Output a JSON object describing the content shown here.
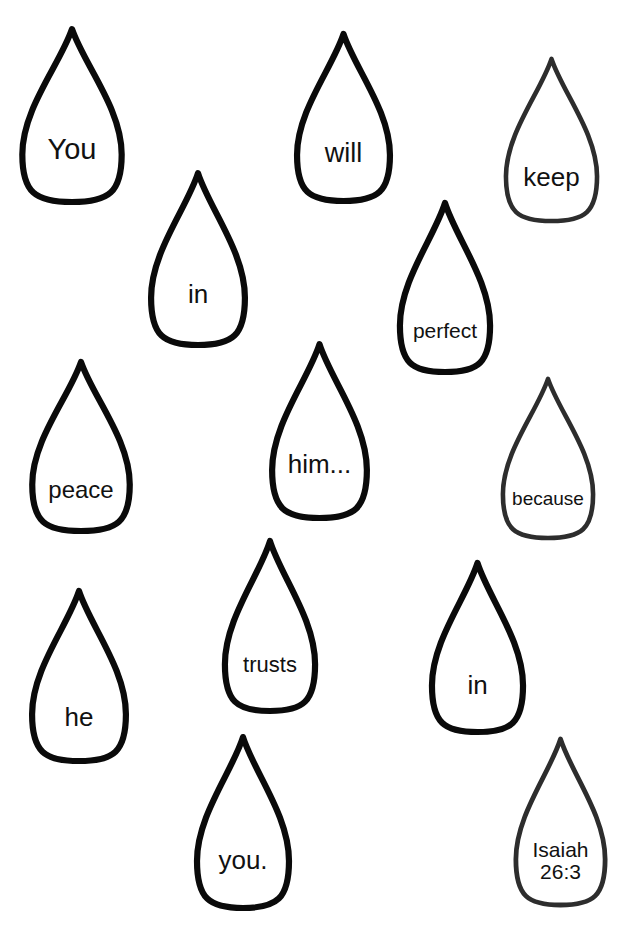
{
  "page": {
    "background_color": "#ffffff",
    "width": 628,
    "height": 929,
    "verse_text": "You will keep in perfect peace him... because he trusts in you.",
    "reference": "Isaiah 26:3"
  },
  "droplets": [
    {
      "id": "drop-you",
      "text": "You",
      "x": 18,
      "y": 26,
      "w": 108,
      "h": 176,
      "font_size": 29,
      "text_offset": 0.7,
      "stroke_color": "#0a0a0a",
      "stroke_width": 6.2
    },
    {
      "id": "drop-will",
      "text": "will",
      "x": 293,
      "y": 31,
      "w": 101,
      "h": 170,
      "font_size": 27,
      "text_offset": 0.72,
      "stroke_color": "#0a0a0a",
      "stroke_width": 6.2
    },
    {
      "id": "drop-keep",
      "text": "keep",
      "x": 502,
      "y": 56,
      "w": 99,
      "h": 165,
      "font_size": 26,
      "text_offset": 0.74,
      "stroke_color": "#2d2d2d",
      "stroke_width": 4.6
    },
    {
      "id": "drop-in-1",
      "text": "in",
      "x": 147,
      "y": 170,
      "w": 102,
      "h": 175,
      "font_size": 26,
      "text_offset": 0.71,
      "stroke_color": "#0a0a0a",
      "stroke_width": 6.2
    },
    {
      "id": "drop-perfect",
      "text": "perfect",
      "x": 396,
      "y": 200,
      "w": 98,
      "h": 172,
      "font_size": 21,
      "text_offset": 0.76,
      "stroke_color": "#0a0a0a",
      "stroke_width": 6.2
    },
    {
      "id": "drop-peace",
      "text": "peace",
      "x": 28,
      "y": 359,
      "w": 106,
      "h": 172,
      "font_size": 24,
      "text_offset": 0.76,
      "stroke_color": "#0a0a0a",
      "stroke_width": 6.2
    },
    {
      "id": "drop-him",
      "text": "him...",
      "x": 268,
      "y": 341,
      "w": 103,
      "h": 177,
      "font_size": 26,
      "text_offset": 0.7,
      "stroke_color": "#0a0a0a",
      "stroke_width": 6.2
    },
    {
      "id": "drop-because",
      "text": "because",
      "x": 499,
      "y": 376,
      "w": 98,
      "h": 162,
      "font_size": 19,
      "text_offset": 0.76,
      "stroke_color": "#2d2d2d",
      "stroke_width": 4.6
    },
    {
      "id": "drop-he",
      "text": "he",
      "x": 28,
      "y": 588,
      "w": 102,
      "h": 173,
      "font_size": 26,
      "text_offset": 0.75,
      "stroke_color": "#0a0a0a",
      "stroke_width": 6.2
    },
    {
      "id": "drop-trusts",
      "text": "trusts",
      "x": 221,
      "y": 538,
      "w": 98,
      "h": 173,
      "font_size": 22,
      "text_offset": 0.73,
      "stroke_color": "#0a0a0a",
      "stroke_width": 6.2
    },
    {
      "id": "drop-in-2",
      "text": "in",
      "x": 428,
      "y": 560,
      "w": 99,
      "h": 172,
      "font_size": 26,
      "text_offset": 0.73,
      "stroke_color": "#0a0a0a",
      "stroke_width": 6.2
    },
    {
      "id": "drop-you-end",
      "text": "you.",
      "x": 193,
      "y": 734,
      "w": 100,
      "h": 174,
      "font_size": 26,
      "text_offset": 0.73,
      "stroke_color": "#0a0a0a",
      "stroke_width": 6.2
    },
    {
      "id": "drop-reference",
      "text": "Isaiah\n26:3",
      "x": 512,
      "y": 736,
      "w": 97,
      "h": 169,
      "font_size": 21,
      "text_offset": 0.74,
      "stroke_color": "#2d2d2d",
      "stroke_width": 4.8
    }
  ]
}
